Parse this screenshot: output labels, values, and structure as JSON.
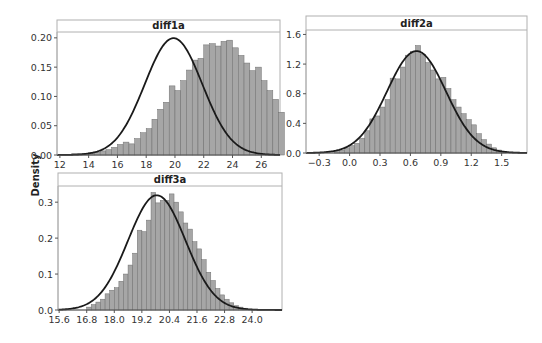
{
  "ylabel": "Density",
  "colors": {
    "bar_fill": "#a6a6a6",
    "bar_stroke": "#6e6e6e",
    "curve": "#1a1a1a",
    "frame": "#b0b0b0",
    "axis": "#555555"
  },
  "chart_data": [
    {
      "type": "bar",
      "title": "diff1a",
      "xlabel": "",
      "ylabel": "Density",
      "xlim": [
        11.8,
        27.3
      ],
      "ylim": [
        0,
        0.21
      ],
      "xticks": [
        12,
        14,
        16,
        18,
        20,
        22,
        24,
        26
      ],
      "xtick_labels": [
        "12",
        "14",
        "16",
        "18",
        "20",
        "22",
        "24",
        "26"
      ],
      "yticks": [
        0,
        0.05,
        0.1,
        0.15,
        0.2
      ],
      "ytick_labels": [
        "0.00",
        "0.05",
        "0.10",
        "0.15",
        "0.20"
      ],
      "bin_start": 12.0,
      "bin_width": 0.4,
      "values": [
        0.001,
        0.001,
        0.002,
        0.002,
        0.003,
        0.004,
        0.005,
        0.007,
        0.009,
        0.013,
        0.018,
        0.022,
        0.019,
        0.028,
        0.038,
        0.045,
        0.061,
        0.078,
        0.09,
        0.118,
        0.11,
        0.127,
        0.145,
        0.162,
        0.165,
        0.188,
        0.19,
        0.186,
        0.194,
        0.196,
        0.183,
        0.17,
        0.157,
        0.144,
        0.15,
        0.127,
        0.11,
        0.095,
        0.073,
        0.062,
        0.052,
        0.043,
        0.033,
        0.03,
        0.022,
        0.016,
        0.011,
        0.008,
        0.005,
        0.004,
        0.003,
        0.002,
        0.001,
        0.001,
        0.001,
        0.001,
        0.001
      ],
      "fit": {
        "type": "normal",
        "mean": 19.9,
        "sd": 2.0
      },
      "grid": false,
      "legend": null
    },
    {
      "type": "bar",
      "title": "diff2a",
      "xlabel": "",
      "ylabel": "",
      "xlim": [
        -0.43,
        1.75
      ],
      "ylim": [
        0,
        1.66
      ],
      "xticks": [
        -0.3,
        0.0,
        0.3,
        0.6,
        0.9,
        1.2,
        1.5
      ],
      "xtick_labels": [
        "−0.3",
        "0.0",
        "0.3",
        "0.6",
        "0.9",
        "1.2",
        "1.5"
      ],
      "yticks": [
        0,
        0.4,
        0.8,
        1.2,
        1.6
      ],
      "ytick_labels": [
        "0.0",
        "0.4",
        "0.8",
        "1.2",
        "1.6"
      ],
      "bin_start": -0.15,
      "bin_width": 0.05,
      "values": [
        0.02,
        0.04,
        0.07,
        0.1,
        0.13,
        0.2,
        0.3,
        0.46,
        0.5,
        0.62,
        0.72,
        1.01,
        1.0,
        1.16,
        1.32,
        1.37,
        1.45,
        1.33,
        1.22,
        1.12,
        1.0,
        1.02,
        0.87,
        0.72,
        0.62,
        0.53,
        0.45,
        0.38,
        0.26,
        0.18,
        0.12,
        0.07,
        0.04,
        0.02
      ],
      "fit": {
        "type": "normal",
        "mean": 0.66,
        "sd": 0.29
      },
      "grid": false,
      "legend": null
    },
    {
      "type": "bar",
      "title": "diff3a",
      "xlabel": "",
      "ylabel": "",
      "xlim": [
        15.55,
        25.3
      ],
      "ylim": [
        0,
        0.345
      ],
      "xticks": [
        15.6,
        16.8,
        18.0,
        19.2,
        20.4,
        21.6,
        22.8,
        24.0
      ],
      "xtick_labels": [
        "15.6",
        "16.8",
        "18.0",
        "19.2",
        "20.4",
        "21.6",
        "22.8",
        "24.0"
      ],
      "yticks": [
        0,
        0.1,
        0.2,
        0.3
      ],
      "ytick_labels": [
        "0.0",
        "0.1",
        "0.2",
        "0.3"
      ],
      "bin_start": 16.8,
      "bin_width": 0.2,
      "values": [
        0.008,
        0.015,
        0.022,
        0.03,
        0.045,
        0.055,
        0.062,
        0.08,
        0.1,
        0.125,
        0.158,
        0.222,
        0.218,
        0.25,
        0.327,
        0.298,
        0.305,
        0.305,
        0.323,
        0.3,
        0.273,
        0.242,
        0.225,
        0.19,
        0.17,
        0.14,
        0.105,
        0.082,
        0.06,
        0.042,
        0.03,
        0.02,
        0.012,
        0.008,
        0.005
      ],
      "fit": {
        "type": "normal",
        "mean": 19.85,
        "sd": 1.25
      },
      "grid": false,
      "legend": null
    }
  ],
  "panels_layout": [
    {
      "left": 57,
      "top": 20,
      "right": 280,
      "header_bottom": 32,
      "axis_bottom": 155
    },
    {
      "left": 306,
      "top": 16,
      "right": 527,
      "header_bottom": 30,
      "axis_bottom": 153
    },
    {
      "left": 58,
      "top": 173,
      "right": 282,
      "header_bottom": 186,
      "axis_bottom": 310
    }
  ]
}
